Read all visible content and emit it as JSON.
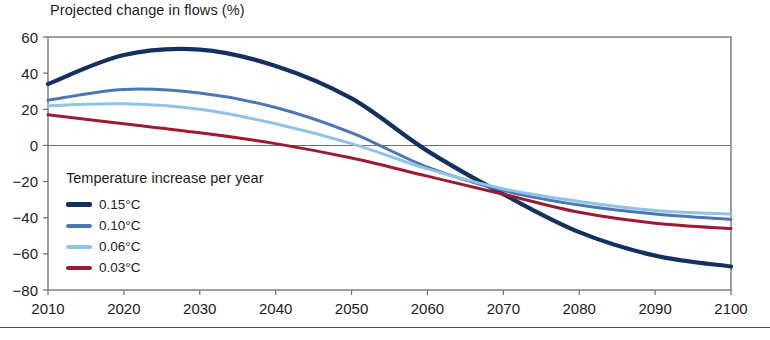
{
  "chart_data": {
    "type": "line",
    "title": "Projected change in flows (%)",
    "xlabel": "",
    "ylabel": "Projected change in flows (%)",
    "xlim": [
      2010,
      2100
    ],
    "ylim": [
      -80,
      60
    ],
    "xticks": [
      "2010",
      "2020",
      "2030",
      "2040",
      "2050",
      "2060",
      "2070",
      "2080",
      "2090",
      "2100"
    ],
    "yticks": [
      "60",
      "40",
      "20",
      "0",
      "−20",
      "−40",
      "−60",
      "−80"
    ],
    "grid": false,
    "zero_line": true,
    "legend_position": "inside-left",
    "legend_title": "Temperature increase per year",
    "x": [
      2010,
      2020,
      2030,
      2040,
      2050,
      2060,
      2070,
      2080,
      2090,
      2100
    ],
    "series": [
      {
        "name": "0.15°C",
        "color": "#12315f",
        "values": [
          34,
          50,
          53,
          44,
          26,
          -3,
          -27,
          -48,
          -61,
          -67
        ]
      },
      {
        "name": "0.10°C",
        "color": "#4b78b5",
        "values": [
          25,
          31,
          29,
          21,
          7,
          -12,
          -25,
          -33,
          -38,
          -41
        ]
      },
      {
        "name": "0.06°C",
        "color": "#8fc4e8",
        "values": [
          22,
          23,
          20,
          12,
          1,
          -13,
          -24,
          -31,
          -36,
          -38
        ]
      },
      {
        "name": "0.03°C",
        "color": "#9c1b33",
        "values": [
          17,
          12,
          7,
          1,
          -7,
          -17,
          -27,
          -37,
          -43,
          -46
        ]
      }
    ]
  },
  "legend": {
    "title": "Temperature increase per year",
    "items": [
      {
        "label": "0.15°C",
        "color": "#12315f"
      },
      {
        "label": "0.10°C",
        "color": "#4b78b5"
      },
      {
        "label": "0.06°C",
        "color": "#8fc4e8"
      },
      {
        "label": "0.03°C",
        "color": "#9c1b33"
      }
    ]
  }
}
